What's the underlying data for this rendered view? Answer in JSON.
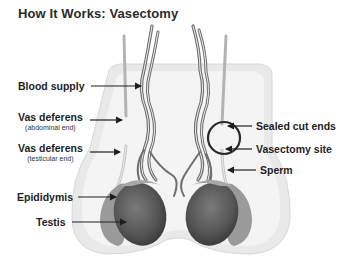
{
  "title": "How It Works: Vasectomy",
  "labels_left": [
    {
      "id": "blood-supply",
      "text": "Blood supply",
      "sub": ""
    },
    {
      "id": "vas-abdominal",
      "text": "Vas deferens",
      "sub": "(abdominal end)"
    },
    {
      "id": "vas-testicular",
      "text": "Vas deferens",
      "sub": "(testicular end)"
    },
    {
      "id": "epididymis",
      "text": "Epididymis",
      "sub": ""
    },
    {
      "id": "testis",
      "text": "Testis",
      "sub": ""
    }
  ],
  "labels_right": [
    {
      "id": "sealed-cut-ends",
      "text": "Sealed cut ends"
    },
    {
      "id": "vasectomy-site",
      "text": "Vasectomy site"
    },
    {
      "id": "sperm",
      "text": "Sperm"
    }
  ],
  "colors": {
    "scrotum_outer": "#e9e9e9",
    "scrotum_inner": "#f3f3f3",
    "testis": "#5a5a5a",
    "epididymis": "#9a9a9a",
    "vessel": "#6e6e6e",
    "vas": "#b3b3b3",
    "arrow": "#1e1e1e",
    "circle": "#2a2a2a"
  }
}
